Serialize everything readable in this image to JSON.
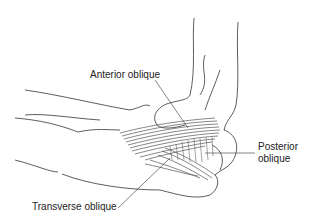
{
  "diagram": {
    "labels": {
      "anterior": "Anterior oblique",
      "posterior_line1": "Posterior",
      "posterior_line2": "oblique",
      "transverse": "Transverse oblique"
    },
    "colors": {
      "outline": "#333333",
      "ligament": "#6e6e6e",
      "ligament_dark": "#4a4a4a",
      "text": "#222222"
    }
  }
}
